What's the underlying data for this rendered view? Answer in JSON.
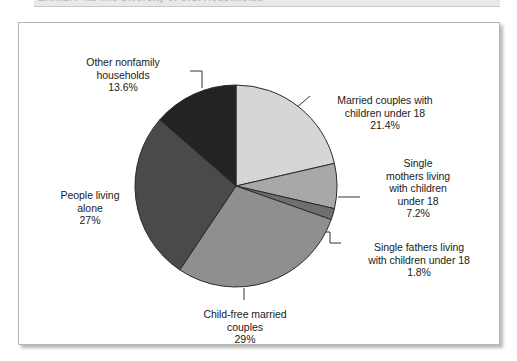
{
  "exhibit": {
    "header_text": "EXHIBIT 4.2    The Diversity of U.S. Households"
  },
  "chart_data": {
    "type": "pie",
    "title": "The Diversity of U.S. Households",
    "legend_position": "callout-labels",
    "grid": false,
    "start_angle_deg": 0,
    "direction": "clockwise",
    "categories": [
      "Married couples with children under 18",
      "Single mothers living with children under 18",
      "Single fathers living with children under 18",
      "Child-free married couples",
      "People living alone",
      "Other nonfamily households"
    ],
    "values": [
      21.4,
      7.2,
      1.8,
      29,
      27,
      13.6
    ],
    "value_labels": [
      "21.4%",
      "7.2%",
      "1.8%",
      "29%",
      "27%",
      "13.6%"
    ],
    "colors": [
      "#d6d6d6",
      "#a8a8a8",
      "#6f6f6f",
      "#8f8f8f",
      "#4a4a4a",
      "#232323"
    ],
    "slices": [
      {
        "name": "married-couples-with-children",
        "label_lines": "Married couples with\nchildren under 18",
        "percent_text": "21.4%",
        "value": 21.4,
        "color": "#d6d6d6"
      },
      {
        "name": "single-mothers-with-children",
        "label_lines": "Single\nmothers living\nwith children\nunder 18",
        "percent_text": "7.2%",
        "value": 7.2,
        "color": "#a8a8a8"
      },
      {
        "name": "single-fathers-with-children",
        "label_lines": "Single fathers living\nwith children under 18",
        "percent_text": "1.8%",
        "value": 1.8,
        "color": "#6f6f6f"
      },
      {
        "name": "child-free-married-couples",
        "label_lines": "Child-free married\ncouples",
        "percent_text": "29%",
        "value": 29,
        "color": "#8f8f8f"
      },
      {
        "name": "people-living-alone",
        "label_lines": "People living\nalone",
        "percent_text": "27%",
        "value": 27,
        "color": "#4a4a4a"
      },
      {
        "name": "other-nonfamily-households",
        "label_lines": "Other nonfamily\nhouseholds",
        "percent_text": "13.6%",
        "value": 13.6,
        "color": "#232323"
      }
    ]
  }
}
